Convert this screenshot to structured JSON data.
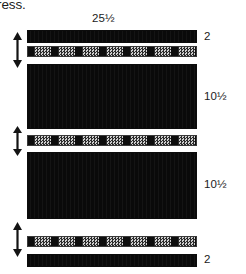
{
  "diagram": {
    "caption_fragment": "ress.",
    "width_label": "25½",
    "layers": [
      {
        "name": "top-face-sheet",
        "label": "2",
        "kind": "solid",
        "top": 30,
        "height": 13
      },
      {
        "name": "upper-core-bond",
        "label": "",
        "kind": "hatched",
        "top": 46,
        "height": 11
      },
      {
        "name": "upper-core",
        "label": "10½",
        "kind": "solid",
        "top": 64,
        "height": 65
      },
      {
        "name": "mid-core-bond",
        "label": "",
        "kind": "hatched",
        "top": 135,
        "height": 11
      },
      {
        "name": "lower-core",
        "label": "10½",
        "kind": "solid",
        "top": 152,
        "height": 67
      },
      {
        "name": "lower-core-bond",
        "label": "",
        "kind": "hatched",
        "top": 236,
        "height": 11
      },
      {
        "name": "bottom-face-sheet",
        "label": "2",
        "kind": "solid",
        "top": 254,
        "height": 13
      }
    ],
    "dimension_labels": [
      {
        "name": "top-face-thickness",
        "text": "2",
        "top": 30
      },
      {
        "name": "upper-core-thickness",
        "text": "10½",
        "top": 90
      },
      {
        "name": "lower-core-thickness",
        "text": "10½",
        "top": 178
      },
      {
        "name": "bottom-face-thickness",
        "text": "2",
        "top": 253
      }
    ],
    "arrows": [
      {
        "name": "upper-bond-gap-arrow",
        "top": 32,
        "height": 36
      },
      {
        "name": "mid-bond-gap-arrow",
        "top": 126,
        "height": 30
      },
      {
        "name": "lower-bond-gap-arrow",
        "top": 222,
        "height": 35
      }
    ],
    "colors": {
      "solid_fill": "#101010",
      "hatch_light": "#cfcfcf",
      "hatch_dark": "#2b2b2b",
      "hatch_block": "#0d0d0d",
      "text": "#1b1b1b",
      "background": "#ffffff"
    }
  }
}
